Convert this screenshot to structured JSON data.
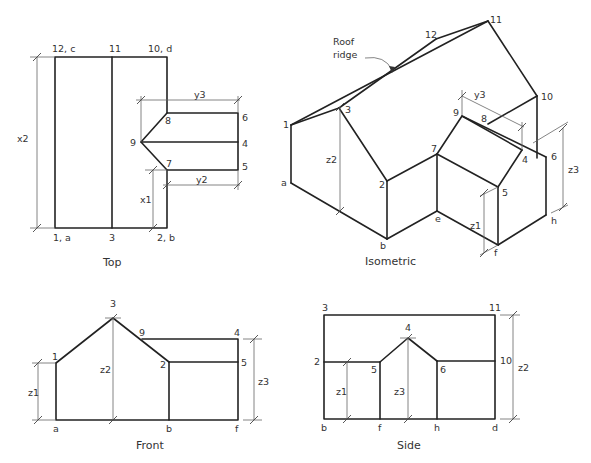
{
  "views": {
    "top": {
      "caption": "Top",
      "labels": {
        "p12c": "12, c",
        "p11": "11",
        "p10d": "10, d",
        "p8": "8",
        "p6": "6",
        "p9": "9",
        "p4": "4",
        "p7": "7",
        "p5": "5",
        "p1a": "1, a",
        "p3": "3",
        "p2b": "2, b"
      },
      "dims": {
        "x2": "x2",
        "x1": "x1",
        "y3": "y3",
        "y2": "y2"
      }
    },
    "isometric": {
      "caption": "Isometric",
      "annotation": {
        "line1": "Roof",
        "line2": "ridge"
      },
      "labels": {
        "p12": "12",
        "p11": "11",
        "p10": "10",
        "p1": "1",
        "p3": "3",
        "p9": "9",
        "p8": "8",
        "p7": "7",
        "p4": "4",
        "p6": "6",
        "pa": "a",
        "p2": "2",
        "p5": "5",
        "pe": "e",
        "ph": "h",
        "pb": "b",
        "pf": "f"
      },
      "dims": {
        "z2": "z2",
        "y3": "y3",
        "z3": "z3",
        "z1": "z1"
      }
    },
    "front": {
      "caption": "Front",
      "labels": {
        "p3": "3",
        "p9": "9",
        "p4": "4",
        "p1": "1",
        "p2": "2",
        "p5": "5",
        "pa": "a",
        "pb": "b",
        "pf": "f"
      },
      "dims": {
        "z1": "z1",
        "z2": "z2",
        "z3": "z3"
      }
    },
    "side": {
      "caption": "Side",
      "labels": {
        "p3": "3",
        "p11": "11",
        "p4": "4",
        "p2": "2",
        "p5": "5",
        "p6": "6",
        "p10": "10",
        "pb": "b",
        "pf": "f",
        "ph": "h",
        "pd": "d"
      },
      "dims": {
        "z1": "z1",
        "z3": "z3",
        "z2": "z2"
      }
    }
  }
}
